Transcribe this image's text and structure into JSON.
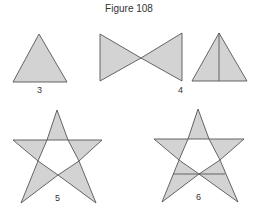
{
  "figure": {
    "title": "Figure 108",
    "colors": {
      "fill": "#d3d3d3",
      "stroke": "#555555",
      "background": "#ffffff"
    },
    "shapes": [
      {
        "id": "triangle",
        "label": "3",
        "description": "Single shaded equilateral triangle"
      },
      {
        "id": "bowtie",
        "label": "",
        "description": "Two shaded triangles meeting at a point (bow-tie)"
      },
      {
        "id": "triangle-with-median",
        "label": "4",
        "description": "Shaded triangle divided by a vertical line from apex to base"
      },
      {
        "id": "star",
        "label": "5",
        "description": "Five-pointed star with shaded points and white inner pentagon"
      },
      {
        "id": "star-with-line",
        "label": "6",
        "description": "Five-pointed star with shaded points, white inner pentagon, plus a horizontal line across the lower legs"
      }
    ]
  }
}
